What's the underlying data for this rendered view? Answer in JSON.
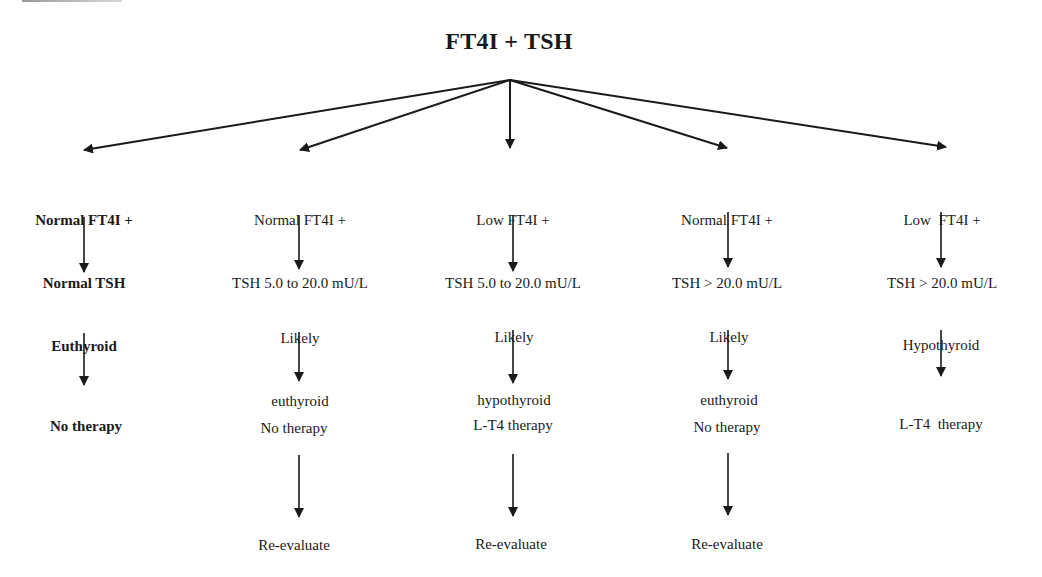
{
  "root": {
    "label": "FT4I + TSH"
  },
  "columns": [
    {
      "condition": [
        "Normal FT4I +",
        "Normal TSH"
      ],
      "diagnosis": [
        "Euthyroid"
      ],
      "action": "No therapy",
      "followup": "",
      "bold": true
    },
    {
      "condition": [
        "Normal FT4I +",
        "TSH 5.0 to 20.0 mU/L"
      ],
      "diagnosis": [
        "Likely",
        "euthyroid"
      ],
      "action": "No therapy",
      "followup": "Re-evaluate",
      "bold": false
    },
    {
      "condition": [
        "Low FT4I +",
        "TSH 5.0 to 20.0 mU/L"
      ],
      "diagnosis": [
        "Likely",
        "hypothyroid"
      ],
      "action": "L-T4 therapy",
      "followup": "Re-evaluate",
      "bold": false
    },
    {
      "condition": [
        "Normal FT4I +",
        "TSH > 20.0 mU/L"
      ],
      "diagnosis": [
        "Likely",
        "euthyroid"
      ],
      "action": "No therapy",
      "followup": "Re-evaluate",
      "bold": false
    },
    {
      "condition": [
        "Low  FT4I +",
        "TSH > 20.0 mU/L"
      ],
      "diagnosis": [
        "Hypothyroid"
      ],
      "action": "L-T4  therapy",
      "followup": "",
      "bold": false
    }
  ],
  "colors": {
    "ink": "#1a1a1a",
    "background": "#ffffff"
  },
  "icons": {
    "arrow": "arrow-down-icon"
  }
}
